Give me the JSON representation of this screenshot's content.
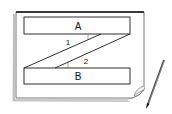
{
  "diagram": {
    "rect_a_label": "A",
    "rect_b_label": "B",
    "angle_1_label": "1",
    "angle_2_label": "2",
    "colors": {
      "line": "#1a1a1a",
      "paper_edge": "#888888",
      "background": "#ffffff"
    }
  }
}
